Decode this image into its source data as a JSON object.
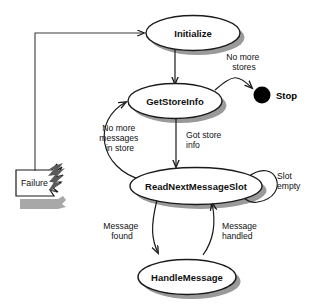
{
  "diagram": {
    "type": "state-machine-diagram",
    "states": [
      {
        "id": "initialize",
        "label": "Initialize",
        "shape": "ellipse"
      },
      {
        "id": "get-store-info",
        "label": "GetStoreInfo",
        "shape": "ellipse"
      },
      {
        "id": "read-next-message-slot",
        "label": "ReadNextMessageSlot",
        "shape": "ellipse"
      },
      {
        "id": "handle-message",
        "label": "HandleMessage",
        "shape": "ellipse"
      }
    ],
    "terminal": {
      "id": "stop",
      "label": "Stop",
      "shape": "filled-circle"
    },
    "note": {
      "id": "failure",
      "label": "Failure",
      "shape": "torn-note"
    },
    "transitions": [
      {
        "id": "t-init-to-getstore",
        "from": "initialize",
        "to": "get-store-info",
        "label": ""
      },
      {
        "id": "t-getstore-to-stop",
        "from": "get-store-info",
        "to": "stop",
        "label": "No more stores",
        "label_lines": [
          "No more",
          "stores"
        ]
      },
      {
        "id": "t-getstore-to-readslot",
        "from": "get-store-info",
        "to": "read-next-message-slot",
        "label": "Got store info",
        "label_lines": [
          "Got store",
          "info"
        ]
      },
      {
        "id": "t-readslot-to-getstore",
        "from": "read-next-message-slot",
        "to": "get-store-info",
        "label": "No more messages in store",
        "label_lines": [
          "No more",
          "messages",
          "in store"
        ]
      },
      {
        "id": "t-readslot-self",
        "from": "read-next-message-slot",
        "to": "read-next-message-slot",
        "label": "Slot empty",
        "label_lines": [
          "Slot",
          "empty"
        ]
      },
      {
        "id": "t-readslot-to-handle",
        "from": "read-next-message-slot",
        "to": "handle-message",
        "label": "Message found",
        "label_lines": [
          "Message",
          "found"
        ]
      },
      {
        "id": "t-handle-to-readslot",
        "from": "handle-message",
        "to": "read-next-message-slot",
        "label": "Message handled",
        "label_lines": [
          "Message",
          "handled"
        ]
      },
      {
        "id": "t-failure-to-initialize",
        "from": "failure",
        "to": "initialize",
        "label": ""
      }
    ],
    "colors": {
      "background": "#ffffff",
      "stroke": "#1a1a1a",
      "shadow": "#9a9a9a",
      "terminal_fill": "#000000",
      "text": "#111111"
    }
  }
}
